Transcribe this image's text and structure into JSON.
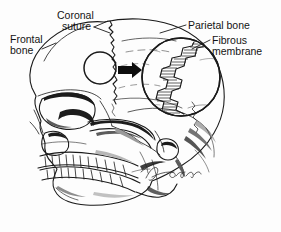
{
  "figure": {
    "background_color": "#fdfdfd",
    "ink_color": "#1a1a1a",
    "width": 281,
    "height": 232,
    "view": "lateral view of human skull, facing left"
  },
  "labels": [
    {
      "id": "coronal-suture",
      "line1": "Coronal",
      "line2": "suture",
      "x": 57,
      "y": 9
    },
    {
      "id": "frontal-bone",
      "line1": "Frontal",
      "line2": "bone",
      "x": 10,
      "y": 33
    },
    {
      "id": "parietal-bone",
      "line1": "Parietal bone",
      "line2": "",
      "x": 188,
      "y": 19
    },
    {
      "id": "fibrous-membrane",
      "line1": "Fibrous",
      "line2": "membrane",
      "x": 212,
      "y": 34
    }
  ],
  "inset": {
    "id": "magnified-suture-inset",
    "description": "Magnified circular inset showing interlocking suture margins joined by fibrous membrane",
    "center_x": 181,
    "center_y": 77,
    "radius": 39,
    "hatch_line_count": 34
  },
  "callout_circle": {
    "id": "suture-detail-circle",
    "center_x": 100,
    "center_y": 68,
    "radius": 16
  },
  "arrow": {
    "id": "magnification-arrow",
    "direction": "right",
    "x_start": 118,
    "x_end": 141,
    "y": 70,
    "color": "#0d0d0d"
  },
  "signature": {
    "id": "artist-signature",
    "text": "Tomchek",
    "x": 148,
    "y": 176,
    "style": "cursive handwritten"
  },
  "anatomy_parts": [
    "frontal bone",
    "parietal bone",
    "coronal suture",
    "temporal bone",
    "sphenoid bone",
    "zygomatic arch",
    "orbit",
    "nasal aperture",
    "maxilla with upper teeth",
    "mandible with lower teeth",
    "occipital region",
    "external acoustic meatus",
    "mastoid process"
  ]
}
